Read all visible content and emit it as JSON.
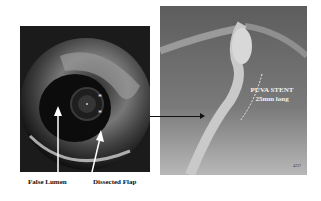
{
  "figure": {
    "left_panel": {
      "type": "IVUS cross-section",
      "labels": {
        "false_lumen": "False Lumen",
        "dissected_flap": "Dissected Flap"
      },
      "markers": [
        "*",
        "*"
      ]
    },
    "right_panel": {
      "type": "angiogram",
      "stent_label_line1": "PUVA STENT",
      "stent_label_line2": "25mm long",
      "image_id": "4237"
    },
    "colors": {
      "background": "#ffffff",
      "arrow": "#111111",
      "label_text": "#f2f2f2"
    }
  }
}
